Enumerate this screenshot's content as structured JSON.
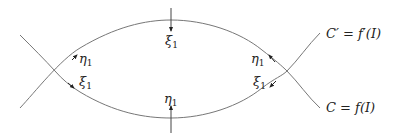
{
  "diagram": {
    "curves": {
      "C": {
        "label": "C = f(I)",
        "parts": [
          "C",
          " = ",
          "f",
          "(",
          "I",
          ")"
        ]
      },
      "C_prime": {
        "label": "C′ = f′(I)",
        "parts": [
          "C′",
          " = ",
          "f′",
          "(",
          "I",
          ")"
        ]
      }
    },
    "labels": {
      "top_xi": {
        "greek": "ξ",
        "sub": "1"
      },
      "bottom_eta": {
        "greek": "η",
        "sub": "1"
      },
      "left_eta": {
        "greek": "η",
        "sub": "1"
      },
      "left_xi": {
        "greek": "ξ",
        "sub": "1"
      },
      "right_eta": {
        "greek": "η",
        "sub": "1"
      },
      "right_xi": {
        "greek": "ξ",
        "sub": "1"
      }
    },
    "colors": {
      "stroke": "#777777",
      "text": "#222222"
    }
  }
}
